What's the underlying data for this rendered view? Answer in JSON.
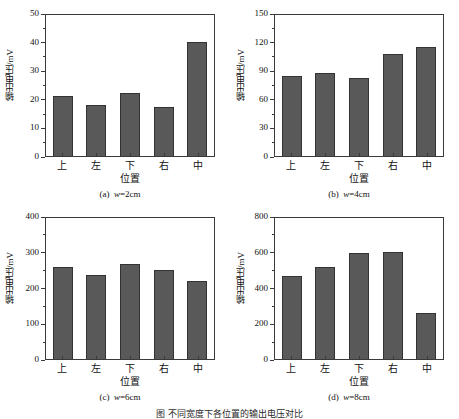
{
  "figure": {
    "background_color": "#ffffff",
    "bar_fill_color": "#595959",
    "bar_edge_color": "#333333",
    "axis_color": "#3a3a3a",
    "bottom_caption_partial": "图    不同宽度下各位置的输出电压对比"
  },
  "chart_data": [
    {
      "type": "bar",
      "panel_id": "a",
      "caption_prefix": "(a)",
      "caption_w": "w",
      "caption_suffix": "=2cm",
      "title": "",
      "xlabel": "位置",
      "ylabel": "输出电压/mV",
      "categories": [
        "上",
        "左",
        "下",
        "右",
        "中"
      ],
      "values": [
        21,
        18,
        22,
        17,
        40
      ],
      "ylim": [
        0,
        50
      ],
      "ytick_major": [
        0,
        10,
        20,
        30,
        40,
        50
      ],
      "ytick_minor": [
        5,
        15,
        25,
        35,
        45
      ],
      "grid": false,
      "legend": "none"
    },
    {
      "type": "bar",
      "panel_id": "b",
      "caption_prefix": "(b)",
      "caption_w": "w",
      "caption_suffix": "=4cm",
      "title": "",
      "xlabel": "位置",
      "ylabel": "输出电压/mV",
      "categories": [
        "上",
        "左",
        "下",
        "右",
        "中"
      ],
      "values": [
        84,
        87,
        82,
        107,
        114
      ],
      "ylim": [
        0,
        150
      ],
      "ytick_major": [
        0,
        30,
        60,
        90,
        120,
        150
      ],
      "ytick_minor": [
        15,
        45,
        75,
        105,
        135
      ],
      "grid": false,
      "legend": "none"
    },
    {
      "type": "bar",
      "panel_id": "c",
      "caption_prefix": "(c)",
      "caption_w": "w",
      "caption_suffix": "=6cm",
      "title": "",
      "xlabel": "位置",
      "ylabel": "输出电压/mV",
      "categories": [
        "上",
        "左",
        "下",
        "右",
        "中"
      ],
      "values": [
        257,
        234,
        265,
        248,
        218
      ],
      "ylim": [
        0,
        400
      ],
      "ytick_major": [
        0,
        100,
        200,
        300,
        400
      ],
      "ytick_minor": [
        50,
        150,
        250,
        350
      ],
      "grid": false,
      "legend": "none"
    },
    {
      "type": "bar",
      "panel_id": "d",
      "caption_prefix": "(d)",
      "caption_w": "w",
      "caption_suffix": "=8cm",
      "title": "",
      "xlabel": "位置",
      "ylabel": "输出电压/mV",
      "categories": [
        "上",
        "左",
        "下",
        "右",
        "中"
      ],
      "values": [
        462,
        517,
        592,
        600,
        256
      ],
      "ylim": [
        0,
        800
      ],
      "ytick_major": [
        0,
        200,
        400,
        600,
        800
      ],
      "ytick_minor": [
        100,
        300,
        500,
        700
      ],
      "grid": false,
      "legend": "none"
    }
  ]
}
